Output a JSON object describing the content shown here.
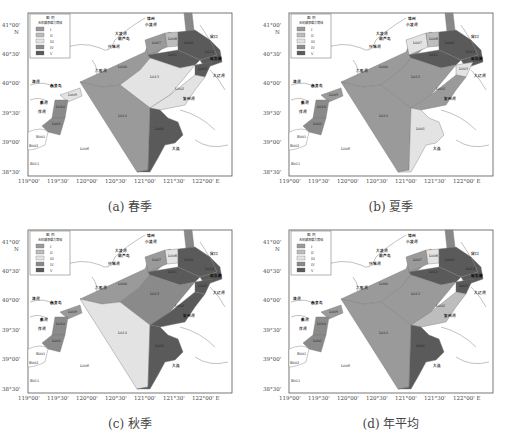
{
  "figure": {
    "panels": [
      {
        "id": "a",
        "caption": "(a) 春季",
        "grades": {
          "L007": "I",
          "L008": "II",
          "L012": "V",
          "L004": "V",
          "L011": "V",
          "L003": "IV",
          "L005": "IV",
          "L013": "III",
          "L002": "II",
          "L009": "II",
          "L010": "IV",
          "L001": "IV",
          "L014": "IV",
          "L001b": "V"
        }
      },
      {
        "id": "b",
        "caption": "(b) 夏季"
      },
      {
        "id": "c",
        "caption": "(c) 秋季"
      },
      {
        "id": "d",
        "caption": "(d) 年平均"
      }
    ],
    "legend": {
      "title": "图 例",
      "subtitle": "无机磷承载力等级",
      "items": [
        {
          "label": "I",
          "color": "#9a9a9a"
        },
        {
          "label": "II",
          "color": "#bdbdbd"
        },
        {
          "label": "III",
          "color": "#e3e3e3"
        },
        {
          "label": "IV",
          "color": "#8a8a8a"
        },
        {
          "label": "V",
          "color": "#5a5a5a"
        }
      ]
    },
    "axes": {
      "x_ticks": [
        "119°00'",
        "119°30'",
        "120°00'",
        "120°30'",
        "121°00'",
        "121°30'",
        "122°00' E"
      ],
      "y_ticks": [
        "41°00'",
        "40°30'",
        "40°00'",
        "39°30'",
        "39°00'",
        "38°30'"
      ],
      "north_label": "N"
    },
    "zone_labels": [
      "L007",
      "L008",
      "L012",
      "L011",
      "L004",
      "L005",
      "L003",
      "L013",
      "L002",
      "L009",
      "L010",
      "L001",
      "L014",
      "L006",
      "L001",
      "B001",
      "B002",
      "B011"
    ],
    "place_labels": [
      "锦州",
      "小凌河",
      "大凌河",
      "葫芦岛",
      "兴城河",
      "六股河",
      "滦河",
      "秦皇岛",
      "戴河",
      "洋河",
      "复州河",
      "大连",
      "太平湾",
      "鲅鱼圈",
      "营口",
      "大辽河"
    ]
  }
}
